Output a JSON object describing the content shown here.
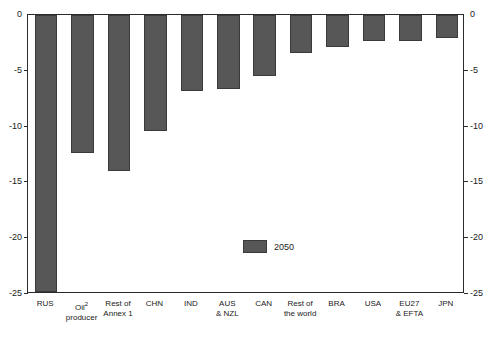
{
  "figure": {
    "title_clipped": "",
    "footnote_clipped": ""
  },
  "legend": {
    "label": "2050",
    "swatch_color": "#575757"
  },
  "axis": {
    "y_ticks_left": [
      "0",
      "-5",
      "-10",
      "-15",
      "-20",
      "-25"
    ],
    "y_ticks_right": [
      "0",
      "-5",
      "-10",
      "-15",
      "-20",
      "-25"
    ]
  },
  "chart_data": {
    "type": "bar",
    "title": "",
    "xlabel": "",
    "ylabel": "",
    "ylim": [
      -25,
      0
    ],
    "grid": false,
    "legend_position": "inside-center-bottom",
    "bar_color": "#575757",
    "categories": [
      "RUS",
      "Oil 2 producer",
      "Rest of Annex 1",
      "CHN",
      "IND",
      "AUS & NZL",
      "CAN",
      "Rest of the world",
      "BRA",
      "USA",
      "EU27 & EFTA",
      "JPN"
    ],
    "category_lines": [
      [
        "RUS",
        ""
      ],
      [
        "Oil",
        "producer"
      ],
      [
        "Rest of",
        "Annex 1"
      ],
      [
        "CHN",
        ""
      ],
      [
        "IND",
        ""
      ],
      [
        "AUS",
        "& NZL"
      ],
      [
        "CAN",
        ""
      ],
      [
        "Rest of",
        "the world"
      ],
      [
        "BRA",
        ""
      ],
      [
        "USA",
        ""
      ],
      [
        "EU27",
        "& EFTA"
      ],
      [
        "JPN",
        ""
      ]
    ],
    "series": [
      {
        "name": "2050",
        "values": [
          -24.8,
          -12.4,
          -14.0,
          -10.4,
          -6.8,
          -6.6,
          -5.5,
          -3.4,
          -2.9,
          -2.3,
          -2.3,
          -2.1
        ]
      }
    ]
  }
}
